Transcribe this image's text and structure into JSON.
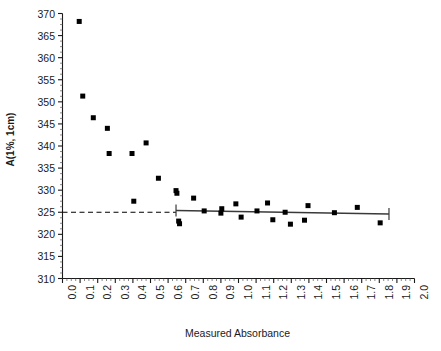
{
  "chart_data": {
    "type": "scatter",
    "title": "",
    "xlabel": "Measured Absorbance",
    "ylabel": "A(1%, 1cm)",
    "xlim": [
      0.0,
      2.0
    ],
    "ylim": [
      310,
      370
    ],
    "grid": false,
    "legend": false,
    "x_ticks": [
      "0.0",
      "0.1",
      "0.2",
      "0.3",
      "0.4",
      "0.5",
      "0.6",
      "0.7",
      "0.8",
      "0.9",
      "1.0",
      "1.1",
      "1.2",
      "1.3",
      "1.4",
      "1.5",
      "1.6",
      "1.7",
      "1.8",
      "1.9",
      "2.0"
    ],
    "x_tick_values": [
      0.0,
      0.1,
      0.2,
      0.3,
      0.4,
      0.5,
      0.6,
      0.7,
      0.8,
      0.9,
      1.0,
      1.1,
      1.2,
      1.3,
      1.4,
      1.5,
      1.6,
      1.7,
      1.8,
      1.9,
      2.0
    ],
    "y_ticks": [
      "310",
      "315",
      "320",
      "325",
      "330",
      "335",
      "340",
      "345",
      "350",
      "355",
      "360",
      "365",
      "370"
    ],
    "y_tick_values": [
      310,
      315,
      320,
      325,
      330,
      335,
      340,
      345,
      350,
      355,
      360,
      365,
      370
    ],
    "x_minor_tick_step": 0.025,
    "y_minor_tick_step": 1.25,
    "marker": "filled-square",
    "marker_color": "#000000",
    "marker_size_px": 5,
    "points": [
      {
        "x": 0.095,
        "y": 368.2
      },
      {
        "x": 0.115,
        "y": 351.3
      },
      {
        "x": 0.175,
        "y": 346.4
      },
      {
        "x": 0.255,
        "y": 344.0
      },
      {
        "x": 0.265,
        "y": 338.3
      },
      {
        "x": 0.395,
        "y": 338.3
      },
      {
        "x": 0.405,
        "y": 327.5
      },
      {
        "x": 0.475,
        "y": 340.7
      },
      {
        "x": 0.545,
        "y": 332.7
      },
      {
        "x": 0.645,
        "y": 329.9
      },
      {
        "x": 0.65,
        "y": 329.3
      },
      {
        "x": 0.665,
        "y": 322.4
      },
      {
        "x": 0.66,
        "y": 323.0
      },
      {
        "x": 0.745,
        "y": 328.2
      },
      {
        "x": 0.805,
        "y": 325.3
      },
      {
        "x": 0.905,
        "y": 325.8
      },
      {
        "x": 0.9,
        "y": 324.8
      },
      {
        "x": 0.985,
        "y": 326.9
      },
      {
        "x": 1.015,
        "y": 323.9
      },
      {
        "x": 1.105,
        "y": 325.3
      },
      {
        "x": 1.165,
        "y": 327.1
      },
      {
        "x": 1.195,
        "y": 323.3
      },
      {
        "x": 1.265,
        "y": 325.0
      },
      {
        "x": 1.295,
        "y": 322.3
      },
      {
        "x": 1.375,
        "y": 323.2
      },
      {
        "x": 1.395,
        "y": 326.5
      },
      {
        "x": 1.545,
        "y": 324.9
      },
      {
        "x": 1.675,
        "y": 326.1
      },
      {
        "x": 1.805,
        "y": 322.6
      }
    ],
    "reference_line": {
      "type": "dashed-horizontal",
      "y": 325,
      "x_start": 0.0,
      "x_end": 0.645,
      "color": "#000000"
    },
    "fit_line": {
      "type": "linear-regression",
      "x_start": 0.645,
      "x_end": 1.855,
      "y_start": 325.4,
      "y_end": 324.6,
      "color": "#3a3a3a",
      "end_caps": true
    }
  }
}
